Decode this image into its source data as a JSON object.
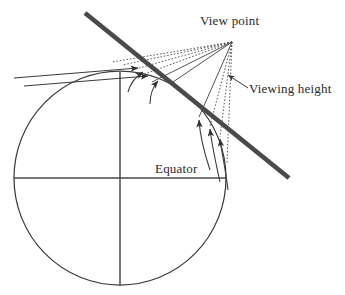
{
  "figure": {
    "width": 345,
    "height": 295,
    "background": "#ffffff",
    "labels": {
      "view_point": "View point",
      "viewing_height": "Viewing height",
      "equator": "Equator"
    },
    "colors": {
      "stroke": "#3a3a3a",
      "thick_line": "#4a4a4a",
      "dotted": "#555555",
      "text": "#2a2a2a",
      "background": "#ffffff"
    },
    "geometry": {
      "globe": {
        "center_x": 120,
        "center_y": 178,
        "radius_x": 106,
        "radius_y": 107,
        "stroke_width": 1.2
      },
      "equator_line": {
        "x1": 14,
        "y1": 178,
        "x2": 226,
        "y2": 178
      },
      "polar_axis": {
        "x1": 120,
        "y1": 72,
        "x2": 120,
        "y2": 285
      },
      "tangent_line": {
        "x1": 85,
        "y1": 13,
        "x2": 289,
        "y2": 178,
        "stroke_width": 4.6
      },
      "view_point": {
        "x": 232,
        "y": 42
      },
      "sight_rays": [
        {
          "x": 118,
          "y": 62,
          "style": "dotted"
        },
        {
          "x": 128,
          "y": 66,
          "style": "dotted"
        },
        {
          "x": 137,
          "y": 72,
          "style": "dotted"
        },
        {
          "x": 147,
          "y": 78,
          "style": "solid"
        },
        {
          "x": 197,
          "y": 113,
          "style": "solid"
        },
        {
          "x": 209,
          "y": 123,
          "style": "dotted"
        },
        {
          "x": 219,
          "y": 133,
          "style": "dotted"
        },
        {
          "x": 226,
          "y": 160,
          "style": "dotted"
        }
      ],
      "arrow_heads": [
        {
          "x": 120,
          "y": 63
        },
        {
          "x": 130,
          "y": 68
        },
        {
          "x": 140,
          "y": 74
        },
        {
          "x": 150,
          "y": 80
        },
        {
          "x": 198,
          "y": 114
        },
        {
          "x": 210,
          "y": 124
        },
        {
          "x": 220,
          "y": 134
        }
      ],
      "viewing_height_pointer": {
        "x1": 246,
        "y1": 87,
        "x2": 227,
        "y2": 74
      }
    }
  }
}
